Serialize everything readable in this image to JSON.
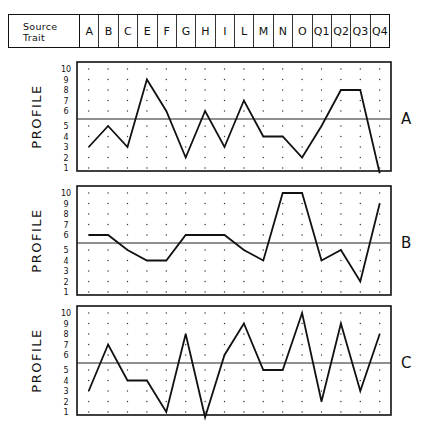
{
  "header": {
    "source_trait_label_line1": "Source",
    "source_trait_label_line2": "Trait",
    "traits": [
      "A",
      "B",
      "C",
      "E",
      "F",
      "G",
      "H",
      "I",
      "L",
      "M",
      "N",
      "O",
      "Q1",
      "Q2",
      "Q3",
      "Q4"
    ]
  },
  "axis": {
    "ylabel": "PROFILE",
    "ticks": [
      10,
      9,
      8,
      7,
      6,
      5,
      4,
      3,
      2,
      1
    ]
  },
  "panels": [
    {
      "label": "A",
      "top": 62
    },
    {
      "label": "B",
      "top": 186
    },
    {
      "label": "C",
      "top": 306
    }
  ],
  "chart_data": {
    "type": "line",
    "title": "",
    "xlabel": "Source Trait",
    "ylabel": "PROFILE",
    "ylim": [
      1,
      10
    ],
    "midline": 5.5,
    "grid": "dotted",
    "categories": [
      "A",
      "B",
      "C",
      "E",
      "F",
      "G",
      "H",
      "I",
      "L",
      "M",
      "N",
      "O",
      "Q1",
      "Q2",
      "Q3",
      "Q4"
    ],
    "series": [
      {
        "name": "A",
        "values": [
          3,
          5,
          3,
          9,
          6,
          2,
          6,
          3,
          7,
          4,
          4,
          2,
          5,
          8,
          8,
          0.5
        ]
      },
      {
        "name": "B",
        "values": [
          6,
          6,
          5,
          4,
          4,
          6,
          6,
          6,
          5,
          4,
          10,
          10,
          4,
          5,
          2,
          9
        ]
      },
      {
        "name": "C",
        "values": [
          3,
          7,
          4,
          4,
          1,
          8,
          0.5,
          6,
          9,
          5,
          5,
          10,
          2,
          9,
          3,
          8
        ]
      }
    ]
  }
}
